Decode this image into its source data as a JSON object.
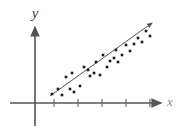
{
  "figure": {
    "width": 184,
    "height": 129,
    "background": "#ffffff",
    "axis_color": "#555555",
    "point_color": "#1a1a1a",
    "line_color": "#555555",
    "label_color": "#3a3a3a",
    "label_color_faint": "#8a8a8a"
  },
  "axes": {
    "x_axis": {
      "label": "x",
      "label_x": 172,
      "label_y": 105,
      "start_x": 10,
      "end_x": 163,
      "y": 103,
      "arrow": true,
      "ticks": [
        54,
        78,
        102,
        126,
        150
      ],
      "tick_half_height": 4
    },
    "y_axis": {
      "label": "y",
      "label_x": 35,
      "label_y": 17,
      "x": 35,
      "top_y": 25,
      "bottom_y": 126,
      "arrow": true,
      "ticks": []
    }
  },
  "chart_data": {
    "type": "scatter",
    "title": "",
    "xlabel": "x",
    "ylabel": "y",
    "grid": false,
    "legend": null,
    "xlim": [
      10,
      163
    ],
    "ylim": [
      25,
      103
    ],
    "note": "Pixel coordinates in figure space; y increases downward in pixels.",
    "points": [
      {
        "x": 52,
        "y": 94
      },
      {
        "x": 58,
        "y": 89
      },
      {
        "x": 62,
        "y": 95
      },
      {
        "x": 66,
        "y": 77
      },
      {
        "x": 70,
        "y": 89
      },
      {
        "x": 72,
        "y": 73
      },
      {
        "x": 74,
        "y": 92
      },
      {
        "x": 80,
        "y": 86
      },
      {
        "x": 84,
        "y": 67
      },
      {
        "x": 88,
        "y": 70
      },
      {
        "x": 90,
        "y": 76
      },
      {
        "x": 94,
        "y": 73
      },
      {
        "x": 96,
        "y": 62
      },
      {
        "x": 100,
        "y": 75
      },
      {
        "x": 103,
        "y": 55
      },
      {
        "x": 107,
        "y": 67
      },
      {
        "x": 110,
        "y": 61
      },
      {
        "x": 114,
        "y": 58
      },
      {
        "x": 116,
        "y": 50
      },
      {
        "x": 118,
        "y": 62
      },
      {
        "x": 122,
        "y": 55
      },
      {
        "x": 126,
        "y": 45
      },
      {
        "x": 130,
        "y": 51
      },
      {
        "x": 134,
        "y": 44
      },
      {
        "x": 138,
        "y": 38
      },
      {
        "x": 142,
        "y": 42
      },
      {
        "x": 146,
        "y": 31
      },
      {
        "x": 150,
        "y": 36
      }
    ],
    "trend_line": {
      "x1": 50,
      "y1": 96,
      "x2": 154,
      "y2": 21,
      "arrow": true,
      "description": "best fit line with arrowhead at upper right"
    }
  }
}
